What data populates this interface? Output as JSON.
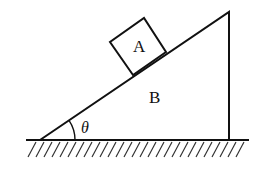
{
  "diagram": {
    "labels": {
      "block": "A",
      "wedge": "B",
      "angle": "θ"
    },
    "colors": {
      "stroke": "#111111",
      "background": "#ffffff"
    },
    "geometry": {
      "ground_y": 140,
      "ground_x_range": [
        26,
        249
      ],
      "incline_bottom": [
        40,
        140
      ],
      "wedge_top": [
        229,
        12
      ],
      "wedge_right_bottom": [
        229,
        140
      ],
      "block_corners": [
        [
          110,
          42
        ],
        [
          144,
          18
        ],
        [
          166,
          52
        ],
        [
          133,
          75
        ]
      ],
      "angle_arc_radius": 35
    }
  }
}
